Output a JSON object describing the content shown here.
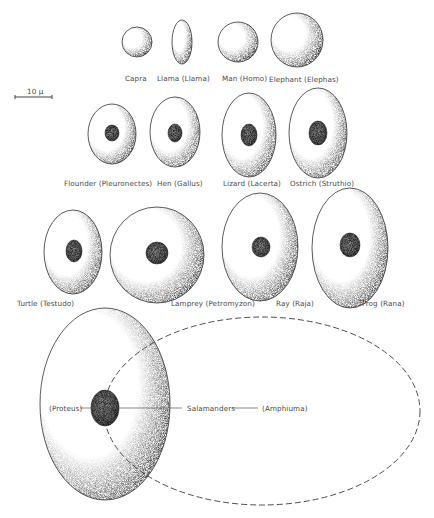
{
  "figure": {
    "scale_bar": {
      "label": "10 μ",
      "x1": 15,
      "x2": 52,
      "y": 97,
      "label_x": 27,
      "label_y": 88
    },
    "colors": {
      "ink": "#333333",
      "stipple": "#6f6f6f",
      "nucleus": "#5a5a5a",
      "label": "#4a4a4a",
      "dashed": "#3a3a3a"
    },
    "cells": [
      {
        "id": "capra",
        "label": "Capra",
        "cx": 137,
        "cy": 42,
        "rx": 15,
        "ry": 15,
        "label_x": 125,
        "label_y": 75
      },
      {
        "id": "llama",
        "label": "Llama (Llama)",
        "cx": 182,
        "cy": 42,
        "rx": 10,
        "ry": 22,
        "label_x": 157,
        "label_y": 75
      },
      {
        "id": "man",
        "label": "Man (Homo)",
        "cx": 238,
        "cy": 42,
        "rx": 20,
        "ry": 20,
        "label_x": 222,
        "label_y": 75
      },
      {
        "id": "elephant",
        "label": "Elephant (Elephas)",
        "cx": 297,
        "cy": 40,
        "rx": 26,
        "ry": 27,
        "label_x": 269,
        "label_y": 76
      },
      {
        "id": "flounder",
        "label": "Flounder (Pleuronectes)",
        "cx": 112,
        "cy": 134,
        "rx": 24,
        "ry": 30,
        "label_x": 64,
        "label_y": 180,
        "nucleus": {
          "cx": 112,
          "cy": 133,
          "rx": 7,
          "ry": 8
        }
      },
      {
        "id": "hen",
        "label": "Hen (Gallus)",
        "cx": 175,
        "cy": 132,
        "rx": 25,
        "ry": 35,
        "label_x": 157,
        "label_y": 180,
        "nucleus": {
          "cx": 175,
          "cy": 133,
          "rx": 7,
          "ry": 9
        }
      },
      {
        "id": "lizard",
        "label": "Lizard (Lacerta)",
        "cx": 249,
        "cy": 135,
        "rx": 27,
        "ry": 42,
        "label_x": 223,
        "label_y": 180,
        "nucleus": {
          "cx": 249,
          "cy": 135,
          "rx": 8,
          "ry": 11
        }
      },
      {
        "id": "ostrich",
        "label": "Ostrich (Struthio)",
        "cx": 318,
        "cy": 133,
        "rx": 29,
        "ry": 45,
        "label_x": 290,
        "label_y": 180,
        "nucleus": {
          "cx": 318,
          "cy": 133,
          "rx": 9,
          "ry": 12
        }
      },
      {
        "id": "turtle",
        "label": "Turtle (Testudo)",
        "cx": 73,
        "cy": 252,
        "rx": 29,
        "ry": 42,
        "label_x": 17,
        "label_y": 300,
        "nucleus": {
          "cx": 74,
          "cy": 251,
          "rx": 8,
          "ry": 11
        }
      },
      {
        "id": "lamprey",
        "label": "Lamprey (Petromyzon)",
        "cx": 157,
        "cy": 255,
        "rx": 47,
        "ry": 48,
        "label_x": 171,
        "label_y": 300,
        "nucleus": {
          "cx": 157,
          "cy": 253,
          "rx": 11,
          "ry": 11
        }
      },
      {
        "id": "ray",
        "label": "Ray (Raja)",
        "cx": 260,
        "cy": 247,
        "rx": 38,
        "ry": 54,
        "label_x": 276,
        "label_y": 300,
        "nucleus": {
          "cx": 261,
          "cy": 247,
          "rx": 9,
          "ry": 10
        }
      },
      {
        "id": "frog",
        "label": "Frog (Rana)",
        "cx": 350,
        "cy": 248,
        "rx": 38,
        "ry": 60,
        "label_x": 362,
        "label_y": 300,
        "nucleus": {
          "cx": 350,
          "cy": 245,
          "rx": 10,
          "ry": 12
        }
      },
      {
        "id": "proteus",
        "label": "(Proteus)",
        "cx": 105,
        "cy": 404,
        "rx": 65,
        "ry": 96,
        "label_x": 49,
        "label_y": 405,
        "nucleus": {
          "cx": 105,
          "cy": 408,
          "rx": 14,
          "ry": 18
        }
      }
    ],
    "amphiuma": {
      "label": "(Amphiuma)",
      "cx": 262,
      "cy": 411,
      "rx": 158,
      "ry": 94,
      "dashed": true,
      "label_x": 262,
      "label_y": 405
    },
    "salamanders": {
      "label": "Salamanders",
      "label_x": 187,
      "label_y": 405,
      "line_left": {
        "x1": 80,
        "x2": 182,
        "y": 408
      },
      "line_right": {
        "x1": 232,
        "x2": 258,
        "y": 408
      }
    }
  }
}
